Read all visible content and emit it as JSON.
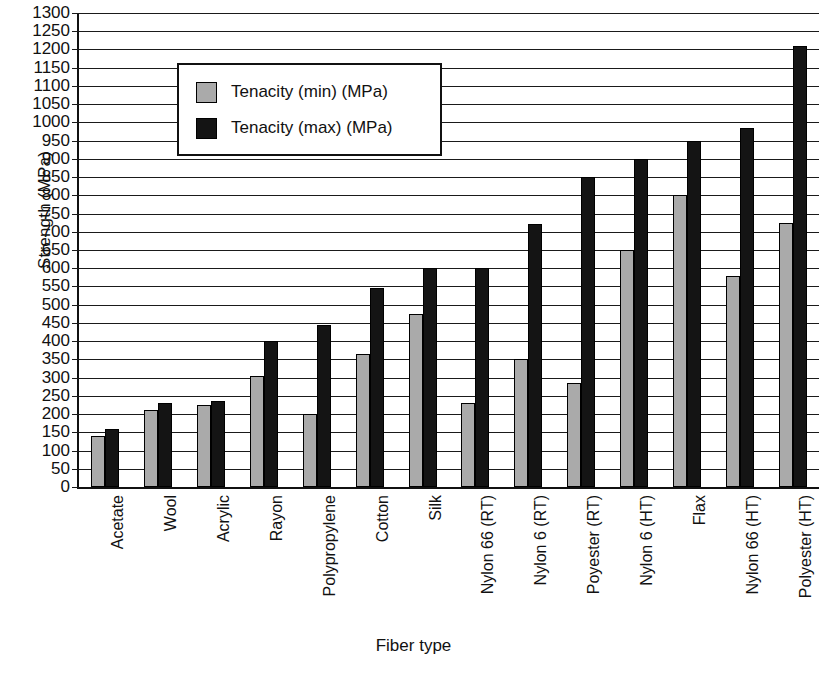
{
  "chart_data": {
    "type": "bar",
    "title": "",
    "xlabel": "Fiber type",
    "ylabel": "Strength (MPa)",
    "ylim": [
      0,
      1300
    ],
    "ytick_step": 50,
    "grid": true,
    "legend_position": "upper-left-inside",
    "yticks": [
      1300,
      1250,
      1200,
      1150,
      1100,
      1050,
      1000,
      950,
      900,
      850,
      800,
      750,
      700,
      650,
      600,
      550,
      500,
      450,
      400,
      350,
      300,
      250,
      200,
      150,
      100,
      50,
      0
    ],
    "categories": [
      "Acetate",
      "Wool",
      "Acrylic",
      "Rayon",
      "Polypropylene",
      "Cotton",
      "Silk",
      "Nylon 66 (RT)",
      "Nylon 6 (RT)",
      "Poyester (RT)",
      "Nylon 6 (HT)",
      "Flax",
      "Nylon 66 (HT)",
      "Polyester (HT)"
    ],
    "series": [
      {
        "name": "Tenacity (min) (MPa)",
        "color": "#aaaaaa",
        "values": [
          140,
          210,
          225,
          305,
          200,
          365,
          475,
          230,
          350,
          285,
          650,
          800,
          580,
          725
        ]
      },
      {
        "name": "Tenacity (max) (MPa)",
        "color": "#141414",
        "values": [
          160,
          230,
          235,
          400,
          445,
          545,
          600,
          600,
          720,
          850,
          900,
          950,
          985,
          1210
        ]
      }
    ]
  },
  "legend": {
    "entries": [
      {
        "label": "Tenacity (min) (MPa)",
        "swatch": "gray-square-icon"
      },
      {
        "label": "Tenacity (max) (MPa)",
        "swatch": "black-square-icon"
      }
    ]
  }
}
